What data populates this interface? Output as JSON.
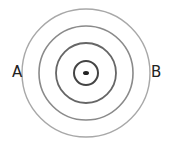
{
  "diagram": {
    "type": "concentric-circles",
    "center": {
      "x": 86,
      "y": 73
    },
    "circles": [
      {
        "r": 64,
        "stroke": "#a8a8a8",
        "width": 1.4
      },
      {
        "r": 47,
        "stroke": "#8a8a8a",
        "width": 1.6
      },
      {
        "r": 30,
        "stroke": "#666666",
        "width": 1.8
      },
      {
        "r": 12,
        "stroke": "#444444",
        "width": 2
      }
    ],
    "labels": {
      "left": "A",
      "right": "B"
    }
  }
}
